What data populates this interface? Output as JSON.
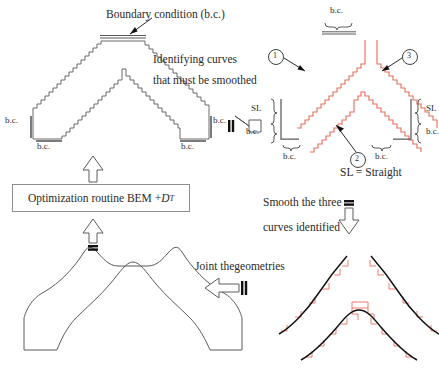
{
  "figure": {
    "colors": {
      "outline": "#5a5a5a",
      "stepped_red": "#e8705f",
      "text": "#2a2a2a",
      "smooth_black": "#111111",
      "box_border": "#8d8d8d",
      "arrow_outline": "#4a4a4a"
    }
  },
  "panel_top_left": {
    "name": "stepped-arch-geometry",
    "annotation_top": "Boundary condition (b.c.)",
    "labels": {
      "left_side": "b.c.",
      "left_foot": "b.c.",
      "right_side": "b.c.",
      "right_foot": "b.c."
    }
  },
  "panel_top_right": {
    "name": "identified-curves",
    "top_label": "b.c.",
    "curve_markers": [
      "1",
      "2",
      "3"
    ],
    "bracket_left": {
      "upper": "SL",
      "lower": "b.c.",
      "foot": "b.c."
    },
    "bracket_right": {
      "upper": "SL",
      "lower": "b.c.",
      "foot": "b.c."
    },
    "legend": "SL  =  Straight"
  },
  "panel_bottom_left": {
    "name": "smoothed-arch-geometry"
  },
  "panel_bottom_right": {
    "name": "smoothed-curves-overlay"
  },
  "optimization_box": {
    "label_prefix": "Optimization routine BEM + ",
    "label_symbol": "D",
    "label_subscript": "T"
  },
  "captions": {
    "identify_line1": "Identifying curves",
    "identify_line2": "that must be smoothed",
    "smooth_line1": "Smooth the three",
    "smooth_line2": "curves identified",
    "joint": "Joint thegeometries"
  }
}
